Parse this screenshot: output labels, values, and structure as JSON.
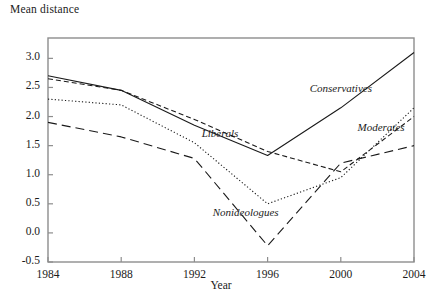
{
  "chart_data": {
    "type": "line",
    "title": "",
    "ylabel": "Mean distance",
    "xlabel": "Year",
    "x": [
      1984,
      1988,
      1992,
      1996,
      2000,
      2004
    ],
    "xtick_labels": [
      "1984",
      "1988",
      "1992",
      "1996",
      "2000",
      "2004"
    ],
    "ytick_labels": [
      "-0.5",
      "0.0",
      "0.5",
      "1.0",
      "1.5",
      "2.0",
      "2.5",
      "3.0"
    ],
    "ytick_values": [
      -0.5,
      0.0,
      0.5,
      1.0,
      1.5,
      2.0,
      2.5,
      3.0
    ],
    "xlim": [
      1984,
      2004
    ],
    "ylim": [
      -0.5,
      3.35
    ],
    "grid": false,
    "legend_position": "inline-annotations",
    "series": [
      {
        "name": "Conservatives",
        "style": "solid",
        "color": "#1a1a1a",
        "values": [
          2.7,
          2.45,
          1.85,
          1.33,
          2.15,
          3.1
        ],
        "label": "Conservatives"
      },
      {
        "name": "Liberals",
        "style": "short-dash",
        "color": "#1a1a1a",
        "values": [
          2.65,
          2.45,
          1.95,
          1.4,
          1.05,
          2.0
        ],
        "label": "Liberals"
      },
      {
        "name": "Moderates",
        "style": "dotted",
        "color": "#1a1a1a",
        "values": [
          2.3,
          2.2,
          1.55,
          0.5,
          0.95,
          2.15
        ],
        "label": "Moderates"
      },
      {
        "name": "Nonideologues",
        "style": "long-dash",
        "color": "#1a1a1a",
        "values": [
          1.9,
          1.65,
          1.28,
          -0.22,
          1.2,
          1.5
        ],
        "label": "Nonideologues"
      }
    ],
    "annotations": [
      {
        "text": "Conservatives",
        "x": 2000,
        "y": 2.45
      },
      {
        "text": "Liberals",
        "x": 1993.4,
        "y": 1.68
      },
      {
        "text": "Moderates",
        "x": 2002.2,
        "y": 1.78
      },
      {
        "text": "Nonideologues",
        "x": 1994.8,
        "y": 0.33
      }
    ],
    "axis_color": "#8d8d8d",
    "frame": "box"
  }
}
